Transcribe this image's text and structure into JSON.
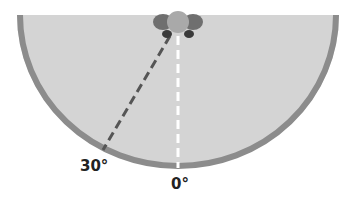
{
  "diagram": {
    "labels": [
      {
        "id": "angle-30",
        "text": "30°"
      },
      {
        "id": "angle-0",
        "text": "0°"
      }
    ],
    "colors": {
      "field": "#d4d4d4",
      "border": "#8c8c8c",
      "dashed_center": "#ffffff",
      "dashed_angle": "#555555",
      "head": "#a9a9a9",
      "ears": "#6f6f6f",
      "shoulders": "#3a3a3a"
    }
  }
}
